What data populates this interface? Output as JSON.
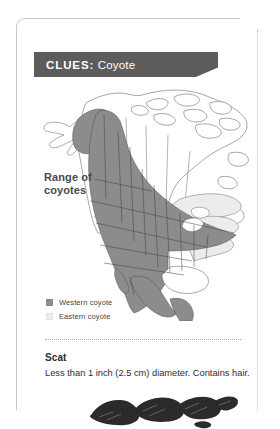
{
  "card": {
    "header": {
      "keyword": "CLUES:",
      "subject": "Coyote",
      "banner_color": "#5c5c5c",
      "text_color": "#ffffff"
    }
  },
  "map": {
    "label": "Range of\ncoyotes",
    "label_line1": "Range of",
    "label_line2": "coyotes",
    "region": "North America",
    "western_fill": "#8c8c8c",
    "eastern_fill": "#ececec",
    "outline_color": "#555555",
    "legend": [
      {
        "label": "Western coyote",
        "swatch": "#8c8c8c",
        "key": "western"
      },
      {
        "label": "Eastern coyote",
        "swatch": "#ececec",
        "key": "eastern"
      }
    ]
  },
  "sections": [
    {
      "heading": "Scat",
      "body": "Less than 1 inch (2.5 cm) diameter. Contains hair."
    }
  ],
  "icons": {
    "scat_photo": "coyote-scat-photo"
  }
}
